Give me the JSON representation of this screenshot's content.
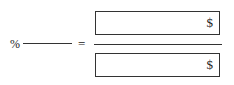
{
  "left": {
    "percent_symbol": "%",
    "percent_value": ""
  },
  "operator": "=",
  "numerator": {
    "value": "",
    "currency_symbol": "$"
  },
  "denominator": {
    "value": "",
    "currency_symbol": "$"
  }
}
